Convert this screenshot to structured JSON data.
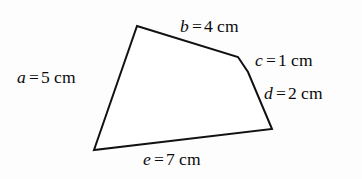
{
  "figure": {
    "type": "polygon-with-labeled-sides",
    "shape_name": "irregular-pentagon",
    "stroke_color": "#111111",
    "fill_color": "#ffffff",
    "background_color": "#fdfdfd",
    "stroke_width": 2,
    "vertices": [
      {
        "name": "top-left-apex",
        "x": 137,
        "y": 26
      },
      {
        "name": "upper-right-bend",
        "x": 238,
        "y": 57
      },
      {
        "name": "mid-right-bend",
        "x": 248,
        "y": 72
      },
      {
        "name": "bottom-right",
        "x": 272,
        "y": 129
      },
      {
        "name": "bottom-left",
        "x": 94,
        "y": 150
      }
    ],
    "sides": [
      {
        "id": "a",
        "variable": "a",
        "equals": "=",
        "value": "5",
        "unit": "cm",
        "text": "a = 5 cm",
        "from_vertex": "bottom-left",
        "to_vertex": "top-left-apex"
      },
      {
        "id": "b",
        "variable": "b",
        "equals": "=",
        "value": "4",
        "unit": "cm",
        "text": "b = 4 cm",
        "from_vertex": "top-left-apex",
        "to_vertex": "upper-right-bend"
      },
      {
        "id": "c",
        "variable": "c",
        "equals": "=",
        "value": "1",
        "unit": "cm",
        "text": "c = 1 cm",
        "from_vertex": "upper-right-bend",
        "to_vertex": "mid-right-bend"
      },
      {
        "id": "d",
        "variable": "d",
        "equals": "=",
        "value": "2",
        "unit": "cm",
        "text": "d = 2 cm",
        "from_vertex": "mid-right-bend",
        "to_vertex": "bottom-right"
      },
      {
        "id": "e",
        "variable": "e",
        "equals": "=",
        "value": "7",
        "unit": "cm",
        "text": "e = 7 cm",
        "from_vertex": "bottom-right",
        "to_vertex": "bottom-left"
      }
    ]
  }
}
